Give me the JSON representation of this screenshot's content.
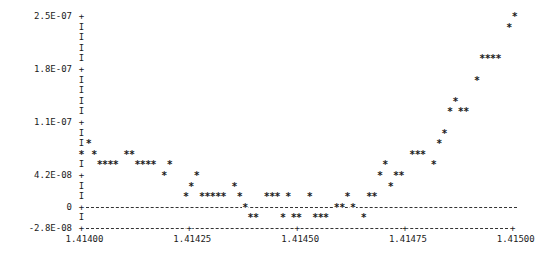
{
  "chart_data": {
    "type": "scatter",
    "title": "",
    "xlabel": "",
    "ylabel": "",
    "style": "line-printer ASCII plot",
    "marker": "*",
    "xlim": [
      1.414,
      1.415
    ],
    "ylim": [
      -2.8e-08,
      2.52e-07
    ],
    "x_ticks": [
      {
        "label": "1.41400",
        "value": 1.414
      },
      {
        "label": "1.41425",
        "value": 1.41425
      },
      {
        "label": "1.41450",
        "value": 1.4145
      },
      {
        "label": "1.41475",
        "value": 1.41475
      },
      {
        "label": "1.41500",
        "value": 1.415
      }
    ],
    "y_ticks": [
      {
        "label": "2.5E-07",
        "value": 2.5e-07,
        "row": 0
      },
      {
        "label": "1.8E-07",
        "value": 1.8e-07,
        "row": 5
      },
      {
        "label": "1.1E-07",
        "value": 1.1e-07,
        "row": 10
      },
      {
        "label": "4.2E-08",
        "value": 4.2e-08,
        "row": 15
      },
      {
        "label": "0",
        "value": 0,
        "row": 18
      },
      {
        "label": "-2.8E-08",
        "value": -2.8e-08,
        "row": 20
      }
    ],
    "grid": {
      "zero_line": true,
      "dashed": true
    },
    "legend": null,
    "grid_columns": 80,
    "grid_rows": 20,
    "points_rowcol": [
      [
        0,
        80
      ],
      [
        1,
        79
      ],
      [
        4,
        74
      ],
      [
        4,
        75
      ],
      [
        4,
        76
      ],
      [
        4,
        77
      ],
      [
        6,
        73
      ],
      [
        8,
        69
      ],
      [
        9,
        68
      ],
      [
        9,
        70
      ],
      [
        9,
        71
      ],
      [
        11,
        67
      ],
      [
        12,
        1
      ],
      [
        12,
        66
      ],
      [
        13,
        0
      ],
      [
        13,
        2
      ],
      [
        13,
        8
      ],
      [
        13,
        9
      ],
      [
        13,
        61
      ],
      [
        13,
        62
      ],
      [
        13,
        63
      ],
      [
        14,
        3
      ],
      [
        14,
        4
      ],
      [
        14,
        5
      ],
      [
        14,
        6
      ],
      [
        14,
        10
      ],
      [
        14,
        11
      ],
      [
        14,
        12
      ],
      [
        14,
        13
      ],
      [
        14,
        16
      ],
      [
        14,
        56
      ],
      [
        14,
        65
      ],
      [
        15,
        15
      ],
      [
        15,
        21
      ],
      [
        15,
        55
      ],
      [
        15,
        58
      ],
      [
        15,
        59
      ],
      [
        16,
        20
      ],
      [
        16,
        28
      ],
      [
        16,
        57
      ],
      [
        17,
        19
      ],
      [
        17,
        22
      ],
      [
        17,
        23
      ],
      [
        17,
        24
      ],
      [
        17,
        25
      ],
      [
        17,
        26
      ],
      [
        17,
        29
      ],
      [
        17,
        34
      ],
      [
        17,
        35
      ],
      [
        17,
        36
      ],
      [
        17,
        38
      ],
      [
        17,
        42
      ],
      [
        17,
        49
      ],
      [
        17,
        53
      ],
      [
        17,
        54
      ],
      [
        18,
        30
      ],
      [
        18,
        47
      ],
      [
        18,
        48
      ],
      [
        18,
        50
      ],
      [
        19,
        31
      ],
      [
        19,
        32
      ],
      [
        19,
        37
      ],
      [
        19,
        39
      ],
      [
        19,
        40
      ],
      [
        19,
        43
      ],
      [
        19,
        44
      ],
      [
        19,
        45
      ],
      [
        19,
        52
      ]
    ],
    "x": [
      1.415,
      1.4149875,
      1.414925,
      1.4149375,
      1.41495,
      1.4149625,
      1.4149125,
      1.4148625,
      1.41485,
      1.414875,
      1.4148875,
      1.4148375,
      1.4140125,
      1.414825,
      1.414,
      1.414025,
      1.4141,
      1.4141125,
      1.4147625,
      1.414775,
      1.4147875,
      1.4140375,
      1.41405,
      1.4140625,
      1.414075,
      1.414125,
      1.4141375,
      1.41415,
      1.4141625,
      1.4142,
      1.4147,
      1.4148125,
      1.4141875,
      1.4142625,
      1.4146875,
      1.414725,
      1.4147375,
      1.41425,
      1.41435,
      1.4147125,
      1.4142375,
      1.414275,
      1.4142875,
      1.4143,
      1.4143125,
      1.414325,
      1.4143625,
      1.414425,
      1.4144375,
      1.41445,
      1.414475,
      1.414525,
      1.4146125,
      1.4146625,
      1.414675,
      1.414375,
      1.4145875,
      1.4146,
      1.414625,
      1.4143875,
      1.4144,
      1.4144625,
      1.4144875,
      1.4145,
      1.4145375,
      1.41455,
      1.4145625,
      1.41465
    ],
    "y": [
      2.52e-07,
      2.38e-07,
      1.96e-07,
      1.96e-07,
      1.96e-07,
      1.96e-07,
      1.68e-07,
      1.4e-07,
      1.26e-07,
      1.26e-07,
      1.26e-07,
      9.8e-08,
      8.4e-08,
      8.4e-08,
      7e-08,
      7e-08,
      7e-08,
      7e-08,
      7e-08,
      7e-08,
      7e-08,
      5.6e-08,
      5.6e-08,
      5.6e-08,
      5.6e-08,
      5.6e-08,
      5.6e-08,
      5.6e-08,
      5.6e-08,
      5.6e-08,
      5.6e-08,
      5.6e-08,
      4.2e-08,
      4.2e-08,
      4.2e-08,
      4.2e-08,
      4.2e-08,
      2.8e-08,
      2.8e-08,
      2.8e-08,
      1.4e-08,
      1.4e-08,
      1.4e-08,
      1.4e-08,
      1.4e-08,
      1.4e-08,
      1.4e-08,
      1.4e-08,
      1.4e-08,
      1.4e-08,
      1.4e-08,
      1.4e-08,
      1.4e-08,
      1.4e-08,
      1.4e-08,
      0,
      0,
      0,
      0,
      -1.4e-08,
      -1.4e-08,
      -1.4e-08,
      -1.4e-08,
      -1.4e-08,
      -1.4e-08,
      -1.4e-08,
      -1.4e-08,
      -1.4e-08
    ]
  },
  "layout": {
    "x0_px": 81.5,
    "col_px": 5.39,
    "y0_px": 16,
    "row_px": 10.6
  }
}
